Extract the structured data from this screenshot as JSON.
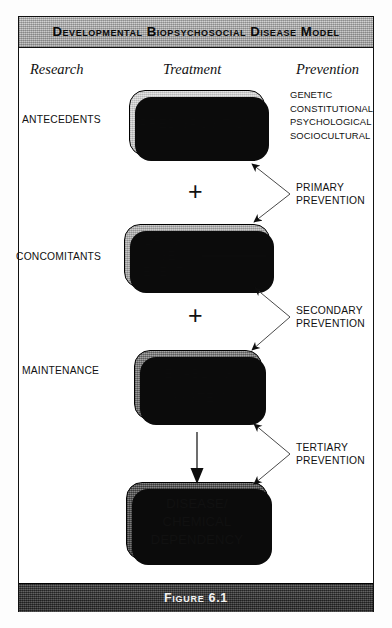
{
  "figure": {
    "title": "Developmental Biopsychosocial Disease Model",
    "caption": "Figure 6.1"
  },
  "columns": {
    "research": "Research",
    "treatment": "Treatment",
    "prevention": "Prevention"
  },
  "stages": {
    "antecedents": "ANTECEDENTS",
    "concomitants": "CONCOMITANTS",
    "maintenance": "MAINTENANCE"
  },
  "boxes": {
    "predisposition": {
      "label": "PREDISPOSITION"
    },
    "drug_use": {
      "line1": "DRUG",
      "line2": "USE",
      "line3": "(EVENT)",
      "sub_top": "INITIATION",
      "sub_bottom": "PROGRESSION"
    },
    "enabling": {
      "line1": "ENABLING",
      "line2": "SYSTEM"
    },
    "disease": {
      "line1": "DISEASE/",
      "line2": "CHEMICAL",
      "line3": "DEPENDENCY"
    }
  },
  "factors": {
    "items": [
      "GENETIC",
      "CONSTITUTIONAL",
      "PSYCHOLOGICAL",
      "SOCIOCULTURAL"
    ]
  },
  "prevention_levels": {
    "primary": {
      "line1": "PRIMARY",
      "line2": "PREVENTION"
    },
    "secondary": {
      "line1": "SECONDARY",
      "line2": "PREVENTION"
    },
    "tertiary": {
      "line1": "TERTIARY",
      "line2": "PREVENTION"
    }
  },
  "operators": {
    "plus1": "+",
    "plus2": "+"
  },
  "colors": {
    "frame": "#111111",
    "header_bar": "#bdbdbd",
    "footer_bar": "#3c3c3c",
    "box_light": "#cfcfcf",
    "box_mid": "#b0b0b0",
    "box_dark": "#848484",
    "box_very_dark": "#646464",
    "shadow": "#0b0b0b"
  }
}
